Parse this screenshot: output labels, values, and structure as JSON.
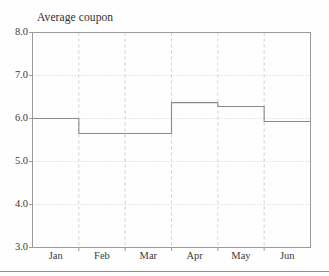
{
  "figure": {
    "title": "Average coupon",
    "background_color": "#fefefe",
    "frame_color": "#9a9a9a",
    "grid_color": "#c8c8d8",
    "series_color": "#8a8a8a"
  },
  "chart_data": {
    "type": "line",
    "title": "Average coupon",
    "xlabel": "",
    "ylabel": "Average coupon",
    "categories": [
      "Jan",
      "Feb",
      "Mar",
      "Apr",
      "May",
      "Jun"
    ],
    "values": [
      6.0,
      5.65,
      5.65,
      6.37,
      6.28,
      5.93
    ],
    "step_style": "step-post",
    "ylim": [
      3.0,
      8.0
    ],
    "yticks": [
      "3.0",
      "4.0",
      "5.0",
      "6.0",
      "7.0",
      "8.0"
    ],
    "ytick_values": [
      3.0,
      4.0,
      5.0,
      6.0,
      7.0,
      8.0
    ],
    "xticks": [
      "Jan",
      "Feb",
      "Mar",
      "Apr",
      "May",
      "Jun"
    ],
    "grid": {
      "horizontal": true,
      "vertical": true,
      "style": "dotted"
    },
    "legend": null,
    "annotations": []
  },
  "axes": {
    "y_labels": [
      "8.0",
      "7.0",
      "6.0",
      "5.0",
      "4.0",
      "3.0"
    ],
    "x_labels": [
      "Jan",
      "Feb",
      "Mar",
      "Apr",
      "May",
      "Jun"
    ]
  }
}
